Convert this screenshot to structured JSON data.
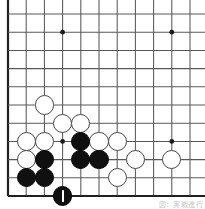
{
  "figure": {
    "kind": "go-board-diagram",
    "caption": "図：実戦進行",
    "board": {
      "region": "bottom-left corner of a 19x19 goban",
      "visible_columns": 11,
      "visible_rows": 11,
      "origin_px": {
        "x": 8.0,
        "y": 196.0
      },
      "spacing_px": 18.2,
      "line_color": "#58585a",
      "edge_color": "#202020",
      "board_color": "#ffffff",
      "star_point_color": "#1a1a1a",
      "star_points": [
        {
          "col": 4,
          "row": 10
        },
        {
          "col": 10,
          "row": 10
        },
        {
          "col": 4,
          "row": 4
        },
        {
          "col": 10,
          "row": 4
        }
      ],
      "edges": {
        "left": true,
        "bottom": true,
        "top": false,
        "right": false
      }
    },
    "stones": [
      {
        "color": "white",
        "col": 3,
        "row": 6
      },
      {
        "color": "white",
        "col": 4,
        "row": 5
      },
      {
        "color": "white",
        "col": 5,
        "row": 5
      },
      {
        "color": "white",
        "col": 2,
        "row": 4
      },
      {
        "color": "white",
        "col": 3,
        "row": 4
      },
      {
        "color": "white",
        "col": 6,
        "row": 4
      },
      {
        "color": "white",
        "col": 7,
        "row": 4
      },
      {
        "color": "white",
        "col": 2,
        "row": 3
      },
      {
        "color": "white",
        "col": 8,
        "row": 3
      },
      {
        "color": "white",
        "col": 10,
        "row": 3
      },
      {
        "color": "white",
        "col": 7,
        "row": 2
      },
      {
        "color": "black",
        "col": 5,
        "row": 4
      },
      {
        "color": "black",
        "col": 3,
        "row": 3
      },
      {
        "color": "black",
        "col": 5,
        "row": 3
      },
      {
        "color": "black",
        "col": 6,
        "row": 3
      },
      {
        "color": "black",
        "col": 2,
        "row": 2
      },
      {
        "color": "black",
        "col": 3,
        "row": 2
      },
      {
        "color": "black",
        "col": 4,
        "row": 1,
        "last_move": true
      }
    ],
    "stone_radius_px": 9.6,
    "last_move_marker": {
      "type": "vertical-tick",
      "color": "#ffffff"
    }
  }
}
